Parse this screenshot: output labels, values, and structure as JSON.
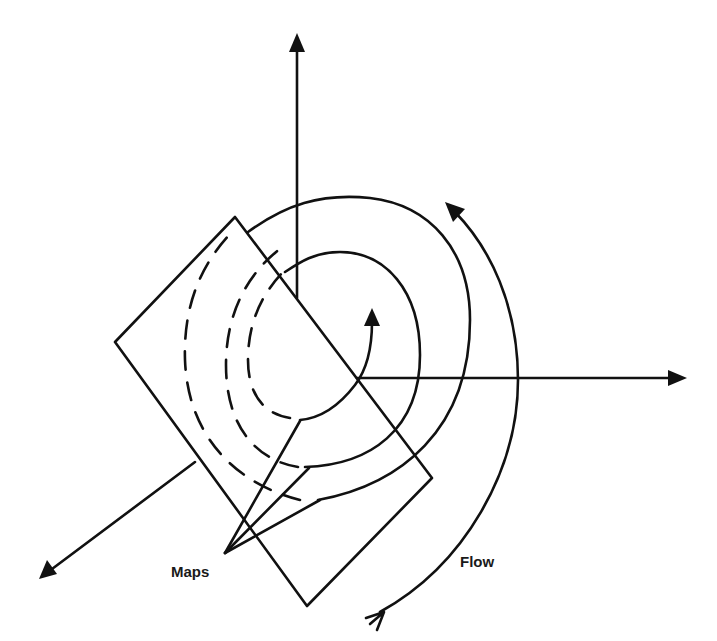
{
  "diagram": {
    "type": "schematic",
    "labels": {
      "maps": "Maps",
      "flow": "Flow"
    },
    "colors": {
      "ink": "#111111",
      "background": "#ffffff"
    },
    "elements": [
      {
        "id": "vertical-axis",
        "kind": "arrow"
      },
      {
        "id": "horizontal-axis",
        "kind": "arrow"
      },
      {
        "id": "diagonal-axis",
        "kind": "arrow"
      },
      {
        "id": "section-plane",
        "kind": "rectangle"
      },
      {
        "id": "inner-curve",
        "kind": "spiral-with-arrow"
      },
      {
        "id": "middle-curve",
        "kind": "curve"
      },
      {
        "id": "outer-curve",
        "kind": "curve"
      },
      {
        "id": "flow-curve",
        "kind": "curved-arrow"
      },
      {
        "id": "maps-pointers",
        "kind": "leader-lines",
        "count": 3
      }
    ]
  }
}
